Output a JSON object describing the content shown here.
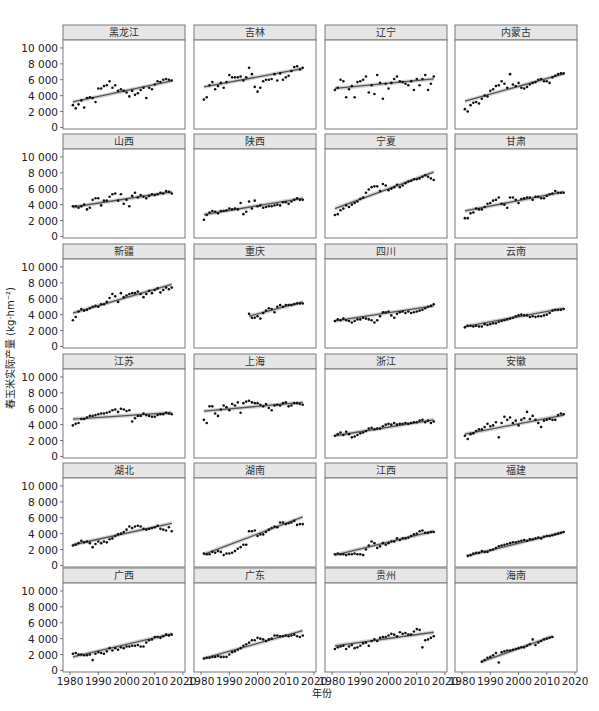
{
  "chart_data": {
    "type": "scatter",
    "layout": "facet-grid",
    "rows": 6,
    "cols": 4,
    "title": "",
    "xlabel": "年份",
    "ylabel": "春玉米实际产量 (kg·hm⁻²)",
    "xlim": [
      1977.5,
      2020.7
    ],
    "ylim": [
      -200,
      11000
    ],
    "x_ticks": [
      1980,
      1990,
      2000,
      2010,
      2020
    ],
    "y_ticks": [
      0,
      2000,
      4000,
      6000,
      8000,
      10000
    ],
    "y_tick_labels": [
      "0",
      "2 000",
      "4 000",
      "6 000",
      "8 000",
      "10 000"
    ],
    "grid": false,
    "legend": "none",
    "fit": "linear regression with grey confidence band",
    "colors": {
      "points": "#111111",
      "fit_line": "#555555",
      "band": "#c8c8c8",
      "strip": "#e6e6e6",
      "border": "#7a7a7a"
    },
    "panels": [
      {
        "name": "黑龙江",
        "years": [
          1981,
          2016
        ],
        "values": [
          2800,
          2400,
          2900,
          3400,
          2500,
          3700,
          3800,
          3700,
          3200,
          4900,
          4900,
          5200,
          5300,
          5800,
          5000,
          5300,
          4600,
          4800,
          4600,
          4400,
          3900,
          4600,
          4100,
          4300,
          4700,
          5000,
          3700,
          5000,
          4800,
          5400,
          5800,
          5700,
          6000,
          6100,
          6000,
          5900
        ],
        "fit": [
          3200,
          5850
        ]
      },
      {
        "name": "吉林",
        "years": [
          1981,
          2016
        ],
        "values": [
          3500,
          3800,
          5300,
          5700,
          4800,
          5200,
          5600,
          5000,
          5700,
          6600,
          6300,
          6300,
          6300,
          6400,
          5900,
          6300,
          7500,
          6700,
          5100,
          4500,
          5000,
          5800,
          6000,
          6000,
          6100,
          6700,
          5900,
          6800,
          6000,
          6300,
          6500,
          7100,
          7600,
          7700,
          7300,
          7500
        ],
        "fit": [
          5100,
          7400
        ]
      },
      {
        "name": "辽宁",
        "years": [
          1981,
          2016
        ],
        "values": [
          4700,
          5000,
          6000,
          5800,
          3800,
          4800,
          5200,
          3800,
          5700,
          5800,
          6000,
          6400,
          4400,
          5300,
          4200,
          6600,
          5600,
          3600,
          5500,
          4900,
          5600,
          6100,
          6400,
          5800,
          5700,
          5500,
          5300,
          5800,
          4700,
          6100,
          5300,
          6100,
          6600,
          4700,
          5500,
          6400
        ],
        "fit": [
          4900,
          6100
        ]
      },
      {
        "name": "内蒙古",
        "years": [
          1981,
          2016
        ],
        "values": [
          2300,
          2000,
          2800,
          3100,
          3200,
          3000,
          3600,
          4000,
          3900,
          4600,
          4800,
          5200,
          5300,
          5800,
          5500,
          5000,
          6700,
          5400,
          5200,
          5600,
          5000,
          4900,
          5100,
          5400,
          5600,
          5700,
          6000,
          6100,
          5800,
          5800,
          5600,
          6300,
          6500,
          6700,
          6800,
          6800
        ],
        "fit": [
          3300,
          6750
        ]
      },
      {
        "name": "山西",
        "years": [
          1981,
          2016
        ],
        "values": [
          3800,
          3800,
          3600,
          3800,
          4000,
          3400,
          3600,
          4600,
          4800,
          4800,
          3900,
          4500,
          4500,
          5000,
          5300,
          5400,
          4500,
          5300,
          4100,
          4600,
          3800,
          5100,
          5500,
          4900,
          5200,
          5000,
          4800,
          5100,
          5300,
          5200,
          5300,
          5500,
          5400,
          5700,
          5600,
          5400
        ],
        "fit": [
          3700,
          5600
        ]
      },
      {
        "name": "陕西",
        "years": [
          1981,
          2016
        ],
        "values": [
          2100,
          2700,
          3000,
          3200,
          3100,
          2900,
          3200,
          3200,
          3300,
          3500,
          3400,
          3500,
          3400,
          4200,
          2800,
          3100,
          4400,
          3500,
          4500,
          3800,
          3900,
          3600,
          3700,
          3800,
          3800,
          3900,
          4000,
          3900,
          4300,
          4300,
          4100,
          4400,
          4600,
          4800,
          4600,
          4600
        ],
        "fit": [
          2750,
          4800
        ]
      },
      {
        "name": "宁夏",
        "years": [
          1981,
          2016
        ],
        "values": [
          2700,
          2800,
          3300,
          3500,
          3900,
          3700,
          4000,
          4200,
          4400,
          4700,
          4900,
          5500,
          5900,
          6200,
          6300,
          6300,
          5700,
          6600,
          6400,
          5800,
          6000,
          6200,
          6500,
          6200,
          6400,
          6700,
          6900,
          7000,
          7200,
          7200,
          7300,
          7500,
          7700,
          7500,
          7300,
          7100
        ],
        "fit": [
          3500,
          8100
        ]
      },
      {
        "name": "甘肃",
        "years": [
          1981,
          2016
        ],
        "values": [
          2300,
          2300,
          2900,
          3000,
          3500,
          3400,
          3400,
          3700,
          4100,
          4200,
          4500,
          4600,
          4900,
          4100,
          4000,
          3600,
          4900,
          4900,
          4600,
          4200,
          4700,
          4800,
          4900,
          4900,
          4600,
          5000,
          5000,
          4800,
          4800,
          5100,
          5300,
          5400,
          5700,
          5500,
          5500,
          5500
        ],
        "fit": [
          3200,
          5600
        ]
      },
      {
        "name": "新疆",
        "years": [
          1981,
          2016
        ],
        "values": [
          3300,
          3700,
          4400,
          4700,
          4500,
          4600,
          4800,
          5000,
          5100,
          5000,
          5300,
          5300,
          5600,
          6100,
          6600,
          6300,
          5600,
          6700,
          6200,
          6400,
          6600,
          6700,
          6700,
          6900,
          6600,
          6200,
          6600,
          7000,
          6700,
          7100,
          7300,
          6800,
          7100,
          7400,
          7200,
          7400
        ],
        "fit": [
          4200,
          7800
        ]
      },
      {
        "name": "重庆",
        "years": [
          1997,
          2016
        ],
        "values": [
          4100,
          3600,
          3600,
          3800,
          3500,
          4200,
          4500,
          4800,
          4700,
          4300,
          5000,
          5200,
          5000,
          5200,
          5200,
          5200,
          5300,
          5400,
          5400,
          5400
        ],
        "fit": [
          3800,
          5600
        ]
      },
      {
        "name": "四川",
        "years": [
          1981,
          2016
        ],
        "values": [
          3200,
          3400,
          3300,
          3500,
          3300,
          3200,
          3000,
          3200,
          3400,
          3400,
          3600,
          3500,
          3400,
          3300,
          3000,
          3300,
          3800,
          4300,
          4300,
          4400,
          3900,
          3600,
          4100,
          4300,
          4400,
          4200,
          4400,
          4200,
          4300,
          4400,
          4500,
          4600,
          4800,
          5000,
          5100,
          5300
        ],
        "fit": [
          3200,
          5100
        ]
      },
      {
        "name": "云南",
        "years": [
          1981,
          2016
        ],
        "values": [
          2400,
          2600,
          2600,
          2500,
          2600,
          2500,
          2500,
          2800,
          2700,
          2800,
          2900,
          2900,
          3100,
          3200,
          3300,
          3400,
          3500,
          3600,
          3800,
          3900,
          4000,
          3900,
          3900,
          3700,
          3800,
          3700,
          3800,
          3800,
          3900,
          4000,
          4200,
          4500,
          4600,
          4600,
          4600,
          4700
        ],
        "fit": [
          2500,
          4800
        ]
      },
      {
        "name": "江苏",
        "years": [
          1981,
          2016
        ],
        "values": [
          3900,
          4100,
          4200,
          4700,
          4700,
          4900,
          5100,
          5100,
          5200,
          5300,
          5400,
          5400,
          5500,
          5600,
          5800,
          5900,
          5600,
          6000,
          5900,
          5700,
          5800,
          4400,
          4800,
          5100,
          5100,
          5400,
          5200,
          5100,
          5000,
          5000,
          5200,
          5300,
          5300,
          5500,
          5400,
          5300
        ],
        "fit": [
          4700,
          5500
        ]
      },
      {
        "name": "上海",
        "years": [
          1981,
          2016
        ],
        "values": [
          4600,
          4200,
          6300,
          6300,
          5400,
          5100,
          5900,
          6400,
          6200,
          5800,
          6600,
          6400,
          6800,
          5500,
          6700,
          6900,
          7000,
          6800,
          6700,
          6700,
          6500,
          6300,
          6600,
          6100,
          5800,
          6400,
          6500,
          6400,
          6700,
          6800,
          6300,
          6400,
          6700,
          6700,
          6600,
          6500
        ],
        "fit": [
          5700,
          6800
        ]
      },
      {
        "name": "浙江",
        "years": [
          1981,
          2016
        ],
        "values": [
          2600,
          2800,
          3000,
          2700,
          3100,
          2800,
          2400,
          2500,
          2700,
          2900,
          3000,
          3200,
          3500,
          3600,
          3400,
          3500,
          3500,
          3800,
          4000,
          4100,
          4000,
          4200,
          4000,
          4100,
          4100,
          4200,
          4100,
          4200,
          4300,
          4300,
          4500,
          4600,
          4300,
          4500,
          4200,
          4400
        ],
        "fit": [
          2600,
          4600
        ]
      },
      {
        "name": "安徽",
        "years": [
          1981,
          2016
        ],
        "values": [
          2600,
          2200,
          2800,
          2900,
          3200,
          3400,
          3400,
          3700,
          4100,
          3800,
          3900,
          4300,
          2400,
          4200,
          5000,
          4600,
          4900,
          4200,
          4500,
          3900,
          4600,
          4800,
          5600,
          4700,
          5100,
          4600,
          4200,
          3700,
          4500,
          4600,
          4700,
          4600,
          4600,
          5200,
          5400,
          5300
        ],
        "fit": [
          2800,
          5200
        ]
      },
      {
        "name": "湖北",
        "years": [
          1981,
          2016
        ],
        "values": [
          2500,
          2600,
          2800,
          3100,
          2900,
          3000,
          2800,
          2300,
          2700,
          3000,
          2800,
          3000,
          2900,
          3300,
          3400,
          3700,
          3900,
          4000,
          4200,
          4500,
          4900,
          4700,
          4900,
          5000,
          4900,
          4600,
          4500,
          4600,
          4700,
          4800,
          5000,
          4600,
          4500,
          4400,
          4800,
          4300
        ],
        "fit": [
          2600,
          5300
        ]
      },
      {
        "name": "湖南",
        "years": [
          1981,
          2016
        ],
        "values": [
          1500,
          1400,
          1400,
          1700,
          1600,
          1800,
          1700,
          1300,
          1500,
          1500,
          1600,
          1800,
          2100,
          2300,
          2600,
          2600,
          4300,
          4300,
          4400,
          3700,
          3900,
          3900,
          4200,
          4500,
          4700,
          4900,
          4800,
          5400,
          5400,
          5200,
          5300,
          5400,
          5600,
          5100,
          5200,
          5200
        ],
        "fit": [
          1400,
          6100
        ]
      },
      {
        "name": "江西",
        "years": [
          1981,
          2016
        ],
        "values": [
          1400,
          1500,
          1400,
          1400,
          1300,
          1400,
          1400,
          1500,
          1400,
          1400,
          1300,
          2000,
          2500,
          3000,
          2800,
          2200,
          2400,
          2800,
          2600,
          2800,
          3000,
          3000,
          3400,
          3200,
          3400,
          3400,
          3500,
          3700,
          3900,
          4000,
          4300,
          4400,
          4100,
          4100,
          4200,
          4200
        ],
        "fit": [
          1300,
          4300
        ]
      },
      {
        "name": "福建",
        "years": [
          1982,
          2016
        ],
        "values": [
          1200,
          1300,
          1500,
          1600,
          1600,
          1800,
          1700,
          1700,
          1900,
          2000,
          2200,
          2400,
          2500,
          2600,
          2700,
          2800,
          2900,
          2900,
          3000,
          3100,
          3200,
          3100,
          3300,
          3300,
          3400,
          3500,
          3400,
          3600,
          3700,
          3700,
          3800,
          3900,
          4000,
          4100,
          4200
        ],
        "fit": [
          1200,
          4200
        ]
      },
      {
        "name": "广西",
        "years": [
          1981,
          2016
        ],
        "values": [
          2100,
          2200,
          2000,
          2000,
          1900,
          1900,
          2000,
          1300,
          2100,
          2300,
          2200,
          2100,
          2400,
          2800,
          2500,
          2800,
          2600,
          2900,
          2800,
          3000,
          3000,
          3100,
          3100,
          3200,
          3000,
          3000,
          3500,
          3800,
          3900,
          4200,
          4200,
          4100,
          4300,
          4500,
          4400,
          4500
        ],
        "fit": [
          1700,
          4600
        ]
      },
      {
        "name": "广东",
        "years": [
          1981,
          2016
        ],
        "values": [
          1500,
          1600,
          1600,
          1700,
          1700,
          1800,
          1700,
          1700,
          1700,
          2000,
          2300,
          2400,
          2600,
          2800,
          3100,
          3300,
          3500,
          3800,
          3800,
          4100,
          4000,
          3900,
          3700,
          3900,
          4000,
          4400,
          4400,
          4300,
          4300,
          4400,
          4300,
          4400,
          4500,
          4300,
          4200,
          4400
        ],
        "fit": [
          1500,
          5000
        ]
      },
      {
        "name": "贵州",
        "years": [
          1981,
          2016
        ],
        "values": [
          2700,
          2900,
          3000,
          3100,
          2700,
          3000,
          3200,
          2800,
          2900,
          3100,
          3400,
          3500,
          3100,
          3700,
          3900,
          3700,
          4100,
          4200,
          4200,
          4400,
          4600,
          4500,
          4300,
          4800,
          4600,
          4700,
          4500,
          4500,
          4900,
          5200,
          5100,
          2900,
          3800,
          3900,
          4100,
          4300
        ],
        "fit": [
          3100,
          4800
        ]
      },
      {
        "name": "海南",
        "years": [
          1987,
          2012
        ],
        "values": [
          1100,
          1300,
          1600,
          1700,
          1900,
          2200,
          1000,
          2300,
          2400,
          2500,
          2500,
          2600,
          2700,
          2800,
          2900,
          2900,
          3100,
          3300,
          3900,
          3200,
          3500,
          3700,
          3900,
          4000,
          4100,
          4200
        ],
        "fit": [
          1100,
          4300
        ]
      }
    ]
  }
}
